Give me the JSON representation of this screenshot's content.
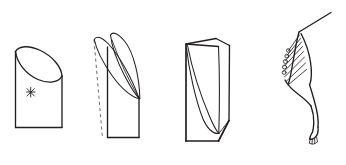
{
  "figure": {
    "background_color": "#ffffff",
    "ink_color": "#231f20",
    "dash_color": "#6f6b6c",
    "width": 346,
    "height": 165,
    "style": "black-and-white line drawing",
    "panel_count": 4
  },
  "panels": [
    {
      "id": "panel-1",
      "name": "cut-cylinder",
      "label": "",
      "description": "Cylinder with oblique elliptical cut at top, front face outlined as a rectangle",
      "annotation": {
        "name": "asterisk-mark",
        "symbol": "✳",
        "label": ""
      }
    },
    {
      "id": "panel-2",
      "name": "twisted-blade-intermediate",
      "label": "",
      "description": "Intermediate form with two curved blade surfaces converging to a lower point, with dashed construction edge at left"
    },
    {
      "id": "panel-3",
      "name": "wedge-prism",
      "label": "",
      "description": "Prismatic wedge block with ruled twisted surface across the front face"
    },
    {
      "id": "panel-4",
      "name": "limb-with-barbs",
      "label": "",
      "description": "Anatomical limb or wing with feather barbs along the upper margin and a clawed foot at the lower end"
    }
  ]
}
